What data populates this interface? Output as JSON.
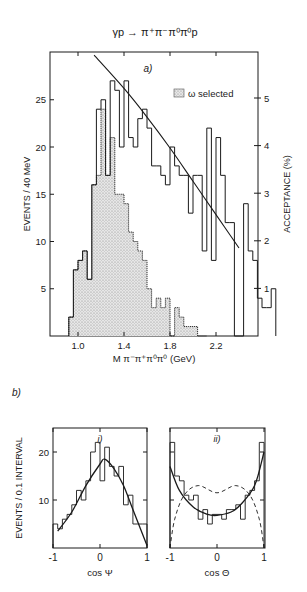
{
  "figure": {
    "reaction_title": "γp → π⁺π⁻π⁰π⁰p",
    "panel_a_label": "a)",
    "panel_b_label": "b)",
    "panel_b_i_label": "i)",
    "panel_b_ii_label": "ii)"
  },
  "chart_data": [
    {
      "type": "bar",
      "panel": "a)",
      "title": "γp → π⁺π⁻π⁰π⁰p",
      "xlabel": "M π⁻π⁺π⁰π⁰ (GeV)",
      "ylabel": "EVENTS / 40 MeV",
      "y2label": "ACCEPTANCE (%)",
      "xlim": [
        0.85,
        2.5
      ],
      "ylim": [
        0,
        30
      ],
      "y2lim": [
        0,
        6
      ],
      "xticks": [
        "1.0",
        "1.4",
        "1.8",
        "2.2"
      ],
      "yticks": [
        "5",
        "10",
        "15",
        "20",
        "25"
      ],
      "y2ticks": [
        "1",
        "2",
        "3",
        "4",
        "5"
      ],
      "bin_width_gev": 0.04,
      "legend": [
        {
          "label": "ω selected",
          "style": "stippled"
        }
      ],
      "series": [
        {
          "name": "all events",
          "style": "step-outline",
          "x_start": 0.92,
          "values": [
            2,
            7,
            8,
            9,
            6,
            16,
            24,
            25,
            17,
            27,
            26,
            20,
            27,
            21,
            20,
            23,
            24,
            22,
            18,
            18,
            17,
            16,
            20,
            18,
            17,
            17,
            13,
            17,
            17,
            9,
            22,
            8,
            21,
            17,
            12,
            12,
            0,
            0,
            14,
            9,
            8,
            4,
            3,
            3,
            5
          ]
        },
        {
          "name": "ω selected",
          "style": "stippled-fill",
          "x_start": 0.92,
          "values": [
            2,
            7,
            8,
            9,
            6,
            16,
            17,
            24,
            17,
            21,
            15,
            15,
            14,
            11,
            10,
            9,
            8,
            5,
            3,
            4,
            3,
            4,
            0,
            3,
            2,
            1,
            1,
            1,
            0,
            0
          ]
        },
        {
          "name": "acceptance",
          "style": "line",
          "axis": "right",
          "x": [
            1.14,
            1.4,
            1.6,
            1.8,
            2.0,
            2.2,
            2.4
          ],
          "values": [
            5.9,
            5.2,
            4.6,
            3.95,
            3.25,
            2.55,
            1.85
          ]
        }
      ]
    },
    {
      "type": "bar",
      "panel": "b) i)",
      "xlabel": "cos Ψ",
      "ylabel": "EVENTS / 0.1 INTERVAL",
      "xlim": [
        -1,
        1
      ],
      "ylim": [
        0,
        25
      ],
      "xticks": [
        "-1",
        "0",
        "1"
      ],
      "yticks": [
        "10",
        "20"
      ],
      "series": [
        {
          "name": "data",
          "style": "step-outline",
          "x_start": -1,
          "values": [
            5,
            4,
            6,
            7,
            9,
            12,
            10,
            14,
            20,
            22,
            14,
            21,
            17,
            15,
            17,
            9,
            11,
            5,
            5,
            5
          ]
        },
        {
          "name": "fit",
          "style": "line",
          "x": [
            -0.9,
            -0.6,
            -0.3,
            0.0,
            0.1,
            0.3,
            0.5,
            0.7,
            1.0
          ],
          "values": [
            3.5,
            7.5,
            13,
            17.5,
            18.5,
            16.5,
            13,
            8,
            0.5
          ]
        }
      ]
    },
    {
      "type": "bar",
      "panel": "b) ii)",
      "xlabel": "cos Θ",
      "ylabel": "EVENTS / 0.1 INTERVAL",
      "xlim": [
        -1,
        1
      ],
      "ylim": [
        0,
        25
      ],
      "xticks": [
        "-1",
        "0",
        "1"
      ],
      "yticks": [
        "10",
        "20"
      ],
      "series": [
        {
          "name": "data",
          "style": "step-outline",
          "x_start": -1,
          "values": [
            22,
            15,
            14,
            11,
            10,
            11,
            6,
            8,
            5,
            7,
            7,
            6,
            8,
            8,
            9,
            6,
            11,
            12,
            14,
            22
          ]
        },
        {
          "name": "fit",
          "style": "line",
          "x": [
            -1.0,
            -0.8,
            -0.5,
            -0.2,
            0.0,
            0.3,
            0.5,
            0.8,
            1.0
          ],
          "values": [
            17,
            12,
            8.5,
            7,
            6.8,
            7.5,
            9,
            13,
            20
          ]
        },
        {
          "name": "alternative",
          "style": "dashed",
          "x": [
            -1.0,
            -0.9,
            -0.7,
            -0.4,
            0.0,
            0.4,
            0.7,
            0.9,
            1.0
          ],
          "values": [
            0,
            6,
            11,
            13,
            11.5,
            13,
            11,
            6,
            0
          ]
        }
      ]
    }
  ]
}
